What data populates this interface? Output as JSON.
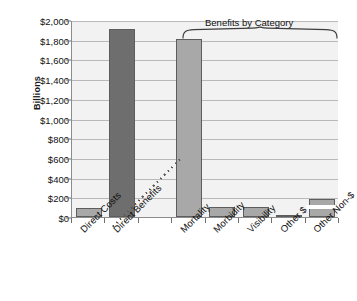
{
  "chart_data": {
    "type": "bar",
    "title": "",
    "xlabel": "",
    "ylabel": "Billions",
    "ylim": [
      0,
      2000
    ],
    "ytick_step": 200,
    "grid": true,
    "legend": "none",
    "categories": [
      "Direct Costs",
      "Direct Benefits",
      "",
      "Mortality",
      "Morbidity",
      "Visibility",
      "Other $",
      "Other Non-$"
    ],
    "values": [
      90,
      1910,
      null,
      1810,
      100,
      100,
      25,
      185
    ],
    "ytick_labels": [
      "$0",
      "$200",
      "$400",
      "$600",
      "$800",
      "$1,000",
      "$1,200",
      "$1,400",
      "$1,600",
      "$1,800",
      "$2,000"
    ],
    "annotations": [
      {
        "text": "Benefits by Category",
        "spans": [
          "Mortality",
          "Morbidity",
          "Visibility",
          "Other $",
          "Other Non-$"
        ],
        "marker": "curly-brace"
      }
    ],
    "series_styles": [
      {
        "name": "Direct / total bars",
        "color": "#6e6e6e",
        "applies_to": [
          "Direct Benefits"
        ]
      },
      {
        "name": "Benefit category bars",
        "color": "#a8a8a8",
        "applies_to": [
          "Direct Costs",
          "Mortality",
          "Morbidity",
          "Visibility",
          "Other $",
          "Other Non-$"
        ]
      }
    ],
    "separator": {
      "style": "dotted-diagonal",
      "after_category": "Direct Benefits"
    }
  },
  "colors": {
    "plot_background": "#f2f2f2",
    "gridline": "#b9b9b9",
    "axis": "#8c8c8c",
    "bar_dark": "#6e6e6e",
    "bar_light": "#a8a8a8",
    "bar_edge": "#5d5d5d",
    "text": "#111111"
  }
}
